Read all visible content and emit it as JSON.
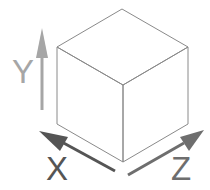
{
  "diagram": {
    "cube": {
      "vertices": {
        "top": [
          122,
          9
        ],
        "left_top": [
          57,
          47
        ],
        "right_top": [
          188,
          47
        ],
        "front_top": [
          123,
          85
        ],
        "left_bottom": [
          57,
          124
        ],
        "right_bottom": [
          188,
          124
        ],
        "front_bottom": [
          123,
          162
        ]
      },
      "edge_color": "#8a8a8a"
    },
    "axes": [
      {
        "name": "Y",
        "label": "Y",
        "color": "#a6a6a6",
        "direction": "up"
      },
      {
        "name": "X",
        "label": "X",
        "color": "#555555",
        "direction": "back-left"
      },
      {
        "name": "Z",
        "label": "Z",
        "color": "#6e6e6e",
        "direction": "back-right"
      }
    ]
  }
}
